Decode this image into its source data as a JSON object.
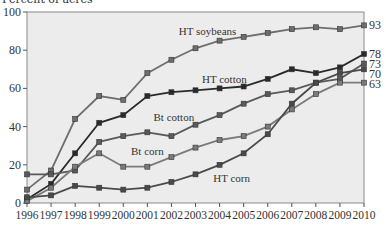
{
  "chart_data": {
    "type": "line",
    "title": "",
    "xlabel": "",
    "ylabel": "Percent of acres",
    "ylim": [
      0,
      100
    ],
    "yticks": [
      0,
      20,
      40,
      60,
      80,
      100
    ],
    "x": [
      1996,
      1997,
      1998,
      1999,
      2000,
      2001,
      2002,
      2003,
      2004,
      2005,
      2006,
      2007,
      2008,
      2009,
      2010
    ],
    "grid": false,
    "legend": "inline labels",
    "series": [
      {
        "name": "HT soybeans",
        "color": "#6e6e6e",
        "end_label": "93",
        "values": [
          7,
          17,
          44,
          56,
          54,
          68,
          75,
          81,
          85,
          87,
          89,
          91,
          92,
          91,
          93
        ]
      },
      {
        "name": "HT cotton",
        "color": "#2a2a2a",
        "end_label": "78",
        "values": [
          2,
          10,
          26,
          42,
          46,
          56,
          58,
          59,
          60,
          61,
          65,
          70,
          68,
          71,
          78
        ]
      },
      {
        "name": "Bt cotton",
        "color": "#5a5a5a",
        "end_label": "73",
        "values": [
          15,
          15,
          17,
          32,
          35,
          37,
          35,
          41,
          46,
          52,
          57,
          59,
          63,
          65,
          73
        ]
      },
      {
        "name": "Bt corn",
        "color": "#7a7a7a",
        "end_label": "63",
        "values": [
          1,
          8,
          19,
          26,
          19,
          19,
          24,
          29,
          33,
          35,
          40,
          49,
          57,
          63,
          63
        ]
      },
      {
        "name": "HT corn",
        "color": "#4a4a4a",
        "end_label": "70",
        "values": [
          3,
          4,
          9,
          8,
          7,
          8,
          11,
          15,
          20,
          26,
          36,
          52,
          63,
          68,
          70
        ]
      }
    ],
    "annotations": [
      {
        "text": "HT soybeans",
        "x": 2003.5,
        "y": 90
      },
      {
        "text": "HT cotton",
        "x": 2004.2,
        "y": 65
      },
      {
        "text": "Bt cotton",
        "x": 2002.1,
        "y": 45
      },
      {
        "text": "Bt corn",
        "x": 2001.0,
        "y": 27
      },
      {
        "text": "HT corn",
        "x": 2004.5,
        "y": 13
      }
    ]
  }
}
